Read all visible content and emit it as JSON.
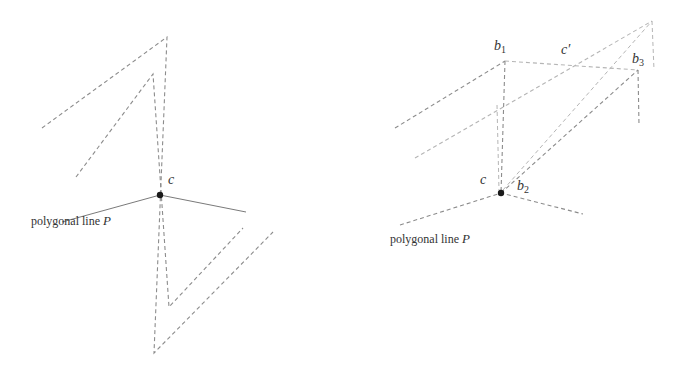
{
  "left_panel": {
    "vertex_label": "c",
    "polygon_label_text": "polygonal line",
    "polygon_label_var": "P"
  },
  "right_panel": {
    "vertex_c_label": "c",
    "b1_label": "b",
    "b1_sub": "1",
    "b2_label": "b",
    "b2_sub": "2",
    "b3_label": "b",
    "b3_sub": "3",
    "c_prime_label": "c′",
    "polygon_label_text": "polygonal line",
    "polygon_label_var": "P"
  },
  "colors": {
    "dashed_line": "#8c8c8c",
    "light_dashed_line": "#b5b5b5",
    "solid_line": "#7a7a7a",
    "vertex_dot": "#1a1a1a",
    "text": "#333333"
  }
}
